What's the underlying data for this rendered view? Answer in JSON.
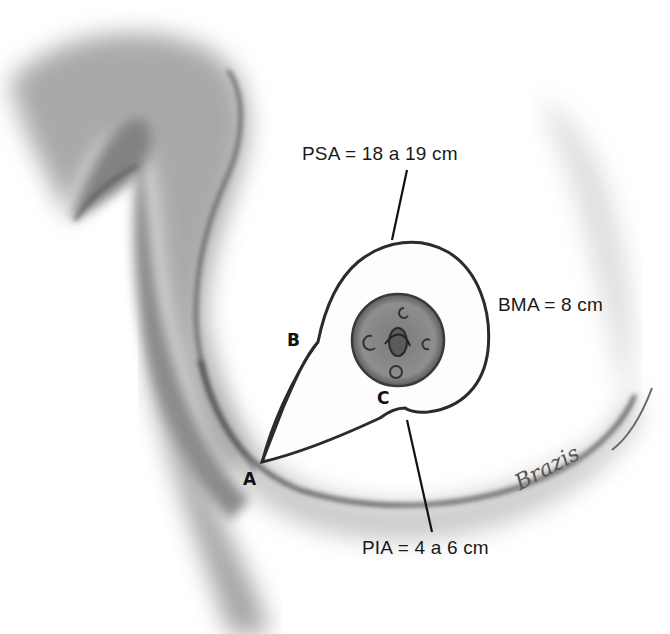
{
  "figure": {
    "type": "anatomical pencil illustration with measurement annotations",
    "labels": {
      "psa": "PSA = 18 a 19 cm",
      "bma": "BMA = 8 cm",
      "pia": "PIA = 4 a 6 cm"
    },
    "points": {
      "a": "A",
      "b": "B",
      "c": "C"
    },
    "signature": "Brazis",
    "colors": {
      "background": "#ffffff",
      "line": "#2b2b2b",
      "shading": "#8a8a8a",
      "text": "#1a1a1a"
    }
  }
}
